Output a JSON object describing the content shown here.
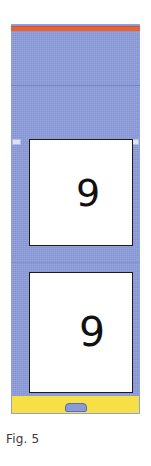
{
  "figure": {
    "caption": "Fig. 5",
    "colors": {
      "body": "#8D9DDB",
      "top_strip": "#EA6234",
      "bottom_bar": "#F7E045",
      "display_background": "#FFFFFF",
      "display_border": "#1B1B1B",
      "corner_tab": "#DFE3F1",
      "bottom_button": "#8A9AD6",
      "seam_line": "#7282C4",
      "caption_text": "#3A3A3A"
    },
    "parts": {
      "top_strip_label": "top-strip",
      "upper_seam_label": "upper-seam-line",
      "lower_seam_label": "lower-seam-line",
      "corner_tab_left_label": "left-corner-tab",
      "corner_tab_right_label": "right-corner-tab",
      "bottom_bar_label": "bottom-yellow-bar",
      "bottom_button_label": "bottom-button"
    },
    "displays": [
      {
        "id": "upper-display",
        "value": "9"
      },
      {
        "id": "lower-display",
        "value": "9"
      }
    ]
  }
}
